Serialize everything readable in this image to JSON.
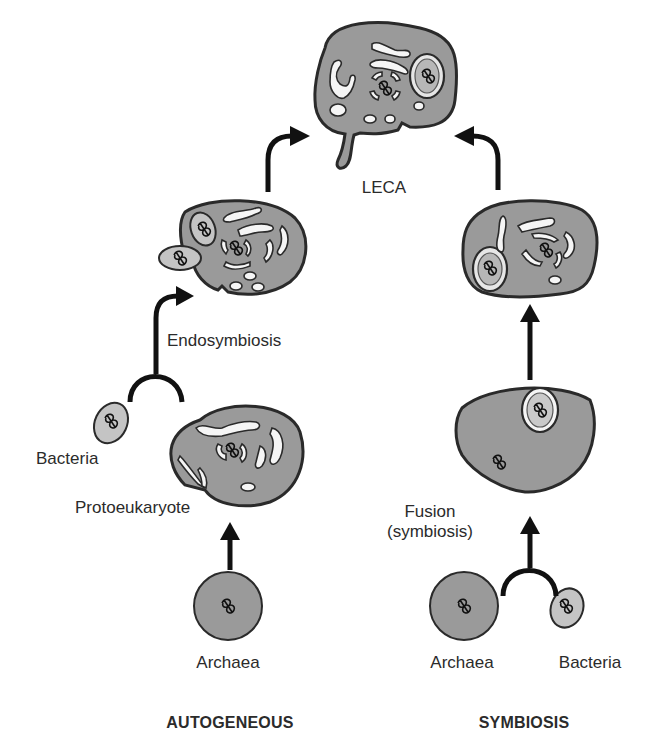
{
  "diagram": {
    "colors": {
      "cell_fill": "#9a9a9a",
      "bacteria_fill": "#c4c4c4",
      "organelle_fill": "#f5f5f5",
      "outline": "#2a2a2a",
      "arrow": "#111111",
      "text": "#2b2b2b"
    },
    "top": {
      "label": "LECA"
    },
    "autogeneous": {
      "heading": "AUTOGENEOUS",
      "steps": [
        {
          "id": "archaea",
          "label": "Archaea"
        },
        {
          "id": "protoeukaryote",
          "label": "Protoeukaryote"
        },
        {
          "id": "bacteria",
          "label": "Bacteria"
        },
        {
          "id": "endosymbiosis",
          "label": "Endosymbiosis"
        }
      ]
    },
    "symbiosis": {
      "heading": "SYMBIOSIS",
      "steps": [
        {
          "id": "archaea",
          "label": "Archaea"
        },
        {
          "id": "bacteria",
          "label": "Bacteria"
        },
        {
          "id": "fusion",
          "label": "Fusion\n(symbiosis)"
        }
      ]
    },
    "icons": [
      "cell-icon",
      "bacterium-icon",
      "dna-icon",
      "mitochondrion-icon",
      "arrow-icon"
    ]
  }
}
